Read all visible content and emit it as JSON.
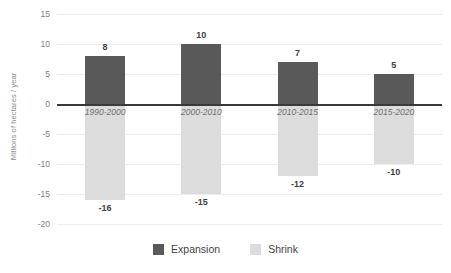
{
  "chart_data": {
    "type": "bar",
    "title": "",
    "subtitle": "",
    "xlabel": "",
    "ylabel": "Millions of hectares / year",
    "categories": [
      "1990-2000",
      "2000-2010",
      "2010-2015",
      "2015-2020"
    ],
    "series": [
      {
        "name": "Expansion",
        "color": "#595959",
        "values": [
          8,
          10,
          7,
          5
        ],
        "labels": [
          "8",
          "10",
          "7",
          "5"
        ]
      },
      {
        "name": "Shrink",
        "color": "#dcdcdc",
        "values": [
          -16,
          -15,
          -12,
          -10
        ],
        "labels": [
          "-16",
          "-15",
          "-12",
          "-10"
        ]
      }
    ],
    "ylim": [
      -20,
      15
    ],
    "yticks": [
      15,
      10,
      5,
      0,
      -5,
      -10,
      -15,
      -20
    ],
    "ytick_labels": [
      "15",
      "10",
      "5",
      "0",
      "-5",
      "-10",
      "-15",
      "-20"
    ],
    "grid": true,
    "legend_position": "bottom"
  },
  "legend": {
    "items": [
      {
        "label": "Expansion",
        "color": "#595959"
      },
      {
        "label": "Shrink",
        "color": "#dcdcdc"
      }
    ]
  },
  "colors": {
    "expansion": "#595959",
    "shrink": "#dcdcdc",
    "axis": "#3a3a3a",
    "grid": "#ededed",
    "tick_text": "#7d7d7d",
    "value_text": "#3f3f3f",
    "category_text": "#6f6f6f",
    "background": "#ffffff"
  }
}
